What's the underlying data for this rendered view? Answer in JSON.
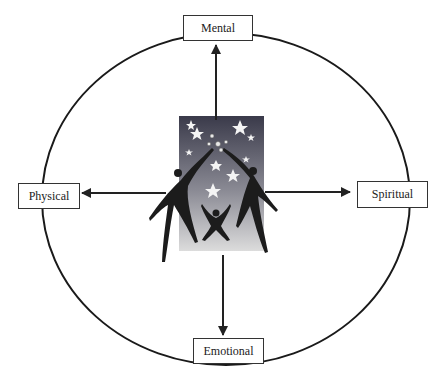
{
  "diagram": {
    "type": "wellness-wheel",
    "center_image": "family-reaching-for-stars-illustration",
    "nodes": {
      "top": {
        "label": "Mental"
      },
      "left": {
        "label": "Physical"
      },
      "right": {
        "label": "Spiritual"
      },
      "bottom": {
        "label": "Emotional"
      }
    },
    "colors": {
      "line": "#222222",
      "gradient_top": "#3a3a4a",
      "gradient_bottom": "#d8d8d8",
      "figure": "#1c1c1c",
      "star": "#f5f5f5"
    }
  }
}
